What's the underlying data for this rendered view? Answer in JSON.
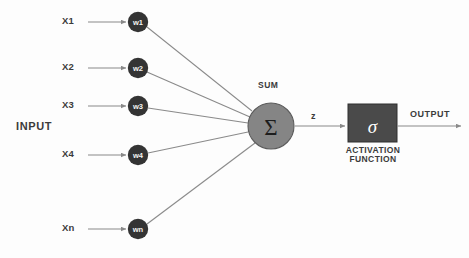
{
  "diagram": {
    "background_color": "#fdfdfd",
    "colors": {
      "weight_node_fill": "#343434",
      "weight_node_text": "#f2f2f2",
      "sum_node_fill": "#858585",
      "sum_node_stroke": "#5c5c5c",
      "activation_box_fill": "#4a4a4a",
      "activation_box_stroke": "#2e2e2e",
      "line_color": "#8a8a8a",
      "text_color": "#3b3b3b"
    },
    "input_section_label": "INPUT",
    "inputs": [
      {
        "label": "X1",
        "weight": "w1",
        "y": 22
      },
      {
        "label": "X2",
        "weight": "w2",
        "y": 68
      },
      {
        "label": "X3",
        "weight": "w3",
        "y": 106
      },
      {
        "label": "X4",
        "weight": "w4",
        "y": 155
      },
      {
        "label": "Xn",
        "weight": "wn",
        "y": 229
      }
    ],
    "sum_node": {
      "caption": "SUM",
      "symbol": "Σ",
      "cx": 271,
      "cy": 126,
      "r": 23
    },
    "intermediate_signal_label": "z",
    "activation": {
      "symbol": "σ",
      "caption_line1": "ACTIVATION",
      "caption_line2": "FUNCTION",
      "box_x": 348,
      "box_y": 104,
      "box_w": 49,
      "box_h": 38
    },
    "output_label": "OUTPUT"
  }
}
